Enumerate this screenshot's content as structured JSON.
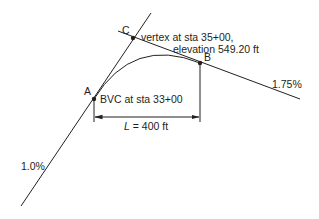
{
  "diagram": {
    "points": {
      "A": {
        "label": "A",
        "description": "BVC at sta 33+00"
      },
      "B": {
        "label": "B"
      },
      "C": {
        "label": "C",
        "description_line1": "vertex at sta 35+00,",
        "description_line2": "elevation 549.20 ft"
      }
    },
    "grades": {
      "incoming": "1.0%",
      "outgoing": "1.75%"
    },
    "dimension": {
      "symbol": "L",
      "equals_value": " = 400 ft"
    },
    "colors": {
      "ink": "#231f20",
      "background": "#ffffff"
    }
  }
}
